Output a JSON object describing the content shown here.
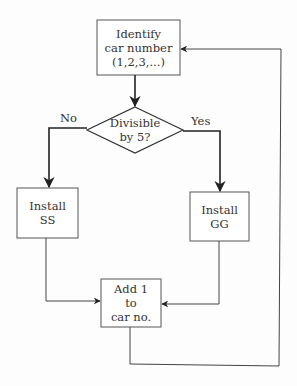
{
  "flowchart": {
    "nodes": {
      "identify": {
        "type": "process",
        "text": "Identify\ncar number\n(1,2,3,...)"
      },
      "decision": {
        "type": "decision",
        "text": "Divisible\nby 5?"
      },
      "install_ss": {
        "type": "process",
        "text": "Install\nSS"
      },
      "install_gg": {
        "type": "process",
        "text": "Install\nGG"
      },
      "add_one": {
        "type": "process",
        "text": "Add 1\nto\ncar no."
      }
    },
    "edges": [
      {
        "from": "identify",
        "to": "decision",
        "label": ""
      },
      {
        "from": "decision",
        "to": "install_ss",
        "label": "No"
      },
      {
        "from": "decision",
        "to": "install_gg",
        "label": "Yes"
      },
      {
        "from": "install_ss",
        "to": "add_one",
        "label": ""
      },
      {
        "from": "install_gg",
        "to": "add_one",
        "label": ""
      },
      {
        "from": "add_one",
        "to": "identify",
        "label": ""
      }
    ],
    "colors": {
      "line": "#2a2a2a",
      "background": "#fdfdfd"
    }
  }
}
